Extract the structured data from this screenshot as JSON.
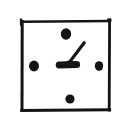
{
  "image": {
    "title": "Hand-drawn analog clock sketch",
    "width": 124,
    "height": 132,
    "background_color": "#ffffff",
    "ink_color": "#141414",
    "style": "monochrome freehand pen sketch"
  },
  "clock": {
    "face_shape": "square",
    "face_label": "square clock face",
    "face": {
      "left": 21,
      "top": 21,
      "right": 110,
      "bottom": 110,
      "stroke_width": 3,
      "color": "#141414"
    },
    "hour_markers": [
      {
        "name": "marker-12",
        "position_label": "12 o'clock",
        "cx": 66,
        "cy": 34,
        "rx": 5.2,
        "ry": 5.8,
        "color": "#141414"
      },
      {
        "name": "marker-3",
        "position_label": "3 o'clock",
        "cx": 99,
        "cy": 66,
        "rx": 4.2,
        "ry": 4.8,
        "color": "#141414"
      },
      {
        "name": "marker-6",
        "position_label": "6 o'clock",
        "cx": 70,
        "cy": 99,
        "rx": 4.6,
        "ry": 4.6,
        "color": "#141414"
      },
      {
        "name": "marker-9",
        "position_label": "9 o'clock",
        "cx": 34,
        "cy": 66,
        "rx": 5.0,
        "ry": 5.4,
        "color": "#141414"
      }
    ],
    "center": {
      "cx": 69,
      "cy": 63
    },
    "hands": [
      {
        "name": "hour-hand",
        "label": "short thick hand pointing left toward 9",
        "x1": 76,
        "y1": 64,
        "x2": 58,
        "y2": 65,
        "stroke_width": 7,
        "points_to": "9",
        "color": "#141414"
      },
      {
        "name": "minute-hand",
        "label": "long thin hand pointing up-right toward 1-2",
        "x1": 67,
        "y1": 64,
        "x2": 84,
        "y2": 43,
        "stroke_width": 3.2,
        "points_to": "1-2",
        "color": "#141414"
      }
    ],
    "reading": "approximately 9:08"
  }
}
